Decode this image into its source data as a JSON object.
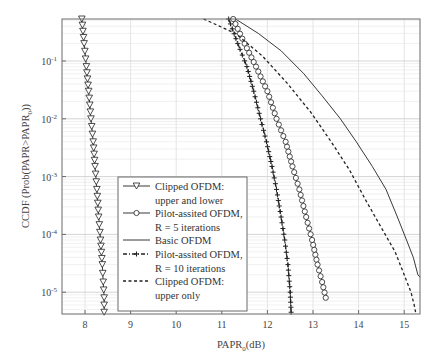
{
  "chart_data": {
    "type": "line",
    "title": "",
    "xlabel": "PAPR_0(dB)",
    "xlabel_main": "PAPR",
    "xlabel_sub": "0",
    "xlabel_tail": "(dB)",
    "ylabel": "CCDF (Prob(PAPR>PAPR_0))",
    "ylabel_main": "CCDF (Prob(PAPR>PAPR",
    "ylabel_sub": "0",
    "ylabel_tail": "))",
    "xlim": [
      7.5,
      15.35
    ],
    "ylim": [
      4.2e-06,
      0.54
    ],
    "yscale": "log",
    "grid": true,
    "x_ticks": [
      8,
      9,
      10,
      11,
      12,
      13,
      14,
      15
    ],
    "x_tick_labels": [
      "8",
      "9",
      "10",
      "11",
      "12",
      "13",
      "14",
      "15"
    ],
    "y_ticks": [
      0.1,
      0.01,
      0.001,
      0.0001,
      1e-05
    ],
    "y_tick_labels": [
      {
        "base": "10",
        "exp": "-1"
      },
      {
        "base": "10",
        "exp": "-2"
      },
      {
        "base": "10",
        "exp": "-3"
      },
      {
        "base": "10",
        "exp": "-4"
      },
      {
        "base": "10",
        "exp": "-5"
      }
    ],
    "legend_position": "lower-left-center",
    "series": [
      {
        "name": "Clipped OFDM: upper and lower",
        "legend_lines": [
          "Clipped OFDM:",
          "upper and lower"
        ],
        "style": "solid",
        "marker": "triangle-down",
        "x": [
          7.93,
          7.98,
          8.03,
          8.08,
          8.13,
          8.18,
          8.22,
          8.26,
          8.3,
          8.34,
          8.38,
          8.4,
          8.42,
          8.42
        ],
        "y": [
          0.54,
          0.2,
          0.08,
          0.03,
          0.01,
          0.004,
          0.0015,
          0.0006,
          0.0002,
          8e-05,
          3e-05,
          1.5e-05,
          8e-06,
          4.5e-06
        ]
      },
      {
        "name": "Pilot-assited OFDM, R = 5 iterations",
        "legend_lines": [
          "Pilot-assited OFDM,",
          "R = 5 iterations"
        ],
        "style": "solid",
        "marker": "circle",
        "x": [
          11.25,
          11.5,
          11.75,
          12.0,
          12.2,
          12.4,
          12.55,
          12.7,
          12.85,
          12.98,
          13.1,
          13.2,
          13.28
        ],
        "y": [
          0.54,
          0.2,
          0.08,
          0.03,
          0.01,
          0.004,
          0.0015,
          0.0006,
          0.0002,
          8e-05,
          3e-05,
          1.5e-05,
          8e-06
        ]
      },
      {
        "name": "Basic OFDM",
        "legend_lines": [
          "Basic OFDM"
        ],
        "style": "solid",
        "marker": "none",
        "x": [
          11.3,
          11.8,
          12.3,
          12.8,
          13.2,
          13.6,
          13.95,
          14.3,
          14.6,
          14.85,
          15.05,
          15.2,
          15.3,
          15.35
        ],
        "y": [
          0.54,
          0.3,
          0.15,
          0.06,
          0.025,
          0.01,
          0.004,
          0.0015,
          0.0006,
          0.0002,
          8e-05,
          4e-05,
          2e-05,
          1.8e-05
        ]
      },
      {
        "name": "Pilot-assited OFDM, R = 10 iterations",
        "legend_lines": [
          "Pilot-assited OFDM,",
          "R = 10 iterations"
        ],
        "style": "dash-dot",
        "marker": "plus",
        "x": [
          11.15,
          11.35,
          11.55,
          11.7,
          11.85,
          11.98,
          12.1,
          12.2,
          12.3,
          12.38,
          12.45,
          12.5,
          12.52
        ],
        "y": [
          0.54,
          0.2,
          0.08,
          0.03,
          0.01,
          0.004,
          0.0015,
          0.0006,
          0.0002,
          8e-05,
          3e-05,
          1e-05,
          4.5e-06
        ]
      },
      {
        "name": "Clipped OFDM: upper only",
        "legend_lines": [
          "Clipped OFDM:",
          "upper only"
        ],
        "style": "dashed",
        "marker": "none",
        "x": [
          10.6,
          11.3,
          11.9,
          12.45,
          12.95,
          13.4,
          13.8,
          14.15,
          14.5,
          14.8,
          15.0,
          15.15,
          15.22,
          15.25
        ],
        "y": [
          0.54,
          0.3,
          0.12,
          0.04,
          0.013,
          0.004,
          0.0013,
          0.0004,
          0.00013,
          5e-05,
          2e-05,
          1e-05,
          6e-06,
          4.5e-06
        ]
      }
    ]
  },
  "colors": {
    "axis": "#6b6b6b",
    "grid": "#dddddd",
    "line": "#222222",
    "background": "#ffffff"
  }
}
